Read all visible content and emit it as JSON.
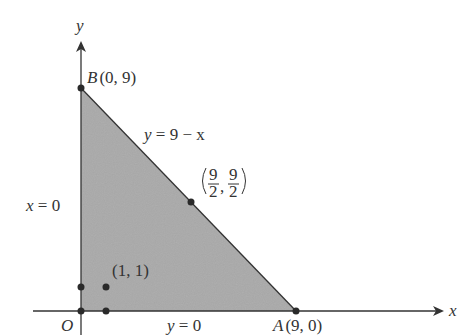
{
  "diagram": {
    "type": "feasible-region",
    "axes": {
      "x_label": "x",
      "y_label": "y",
      "origin_label": "O"
    },
    "vertices": [
      {
        "name": "B",
        "label": "B",
        "coords": "(0, 9)"
      },
      {
        "name": "A",
        "label": "A",
        "coords": "(9, 0)"
      },
      {
        "name": "O",
        "label": "O",
        "coords": "(0, 0)"
      }
    ],
    "lines": [
      {
        "equation_lhs": "y",
        "equation_rhs": "9 − x",
        "text": "y = 9 − x"
      },
      {
        "text": "x = 0",
        "lhs": "x",
        "rhs": "0"
      },
      {
        "text": "y = 0",
        "lhs": "y",
        "rhs": "0"
      }
    ],
    "points": [
      {
        "label": "(1, 1)"
      },
      {
        "label": "(9/2, 9/2)",
        "num1": "9",
        "den1": "2",
        "num2": "9",
        "den2": "2"
      }
    ],
    "colors": {
      "region_fill": "#a9a9a9",
      "axis": "#333333",
      "point": "#2a2a2a"
    }
  }
}
